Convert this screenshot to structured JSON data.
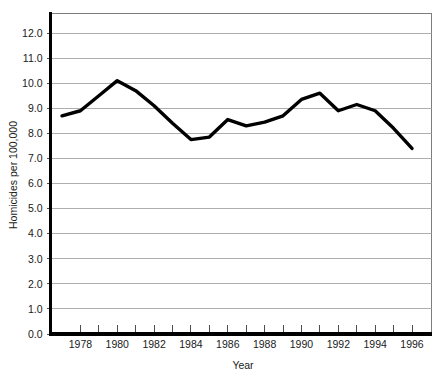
{
  "chart_data": {
    "type": "line",
    "title": "",
    "xlabel": "Year",
    "ylabel": "Homicides per 100,000",
    "xlim": [
      1977,
      1997
    ],
    "ylim": [
      0.0,
      12.6
    ],
    "grid": true,
    "legend": "none",
    "x": [
      1977,
      1978,
      1979,
      1980,
      1981,
      1982,
      1983,
      1984,
      1985,
      1986,
      1987,
      1988,
      1989,
      1990,
      1991,
      1992,
      1993,
      1994,
      1995,
      1996
    ],
    "values": [
      8.7,
      8.9,
      9.5,
      10.1,
      9.7,
      9.1,
      8.4,
      7.75,
      7.85,
      8.55,
      8.3,
      8.45,
      8.7,
      9.35,
      9.6,
      8.9,
      9.15,
      8.9,
      8.2,
      7.4
    ],
    "series": [
      {
        "name": "Homicide rate",
        "color": "#000000",
        "values": [
          8.7,
          8.9,
          9.5,
          10.1,
          9.7,
          9.1,
          8.4,
          7.75,
          7.85,
          8.55,
          8.3,
          8.45,
          8.7,
          9.35,
          9.6,
          8.9,
          9.15,
          8.9,
          8.2,
          7.4
        ]
      }
    ],
    "y_tick_labels": [
      "0.0",
      "1.0",
      "2.0",
      "3.0",
      "4.0",
      "5.0",
      "6.0",
      "7.0",
      "8.0",
      "9.0",
      "10.0",
      "11.0",
      "12.0"
    ],
    "y_tick_values": [
      0,
      1,
      2,
      3,
      4,
      5,
      6,
      7,
      8,
      9,
      10,
      11,
      12
    ],
    "x_tick_labels": [
      "1978",
      "1980",
      "1982",
      "1984",
      "1986",
      "1988",
      "1990",
      "1992",
      "1994",
      "1996"
    ],
    "x_tick_values": [
      1978,
      1980,
      1982,
      1984,
      1986,
      1988,
      1990,
      1992,
      1994,
      1996
    ],
    "x_minor_ticks": [
      1978,
      1979,
      1980,
      1981,
      1982,
      1983,
      1984,
      1985,
      1986,
      1987,
      1988,
      1989,
      1990,
      1991,
      1992,
      1993,
      1994,
      1995,
      1996
    ],
    "colors": {
      "line": "#000000",
      "grid": "#9a9a9a",
      "axis": "#000000",
      "border": "#6f6f6f",
      "text": "#1a1a1a",
      "background": "#ffffff"
    }
  }
}
